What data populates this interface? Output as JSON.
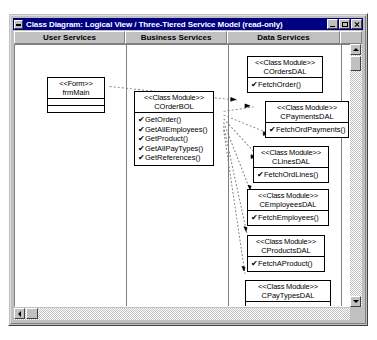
{
  "window": {
    "title": "Class Diagram: Logical View / Three-Tiered Service Model (read-only)",
    "minimize_label": "Minimize",
    "maximize_label": "Maximize",
    "close_label": "Close"
  },
  "columns": [
    {
      "label": "User Services"
    },
    {
      "label": "Business Services"
    },
    {
      "label": "Data Services"
    },
    {
      "label": ""
    }
  ],
  "classes": {
    "frm_main": {
      "stereotype": "<<Form>>",
      "name": "frmMain",
      "ops": []
    },
    "order_bol": {
      "stereotype": "<<Class Module>>",
      "name": "COrderBOL",
      "ops": [
        "GetOrder()",
        "GetAllEmployees()",
        "GetProduct()",
        "GetAllPayTypes()",
        "GetReferences()"
      ]
    },
    "orders_dal": {
      "stereotype": "<<Class Module>>",
      "name": "COrdersDAL",
      "ops": [
        "FetchOrder()"
      ]
    },
    "payments_dal": {
      "stereotype": "<<Class Module>>",
      "name": "CPaymentsDAL",
      "ops": [
        "FetchOrdPayments()"
      ]
    },
    "lines_dal": {
      "stereotype": "<<Class Module>>",
      "name": "CLinesDAL",
      "ops": [
        "FetchOrdLines()"
      ]
    },
    "employees_dal": {
      "stereotype": "<<Class Module>>",
      "name": "CEmployeesDAL",
      "ops": [
        "FetchEmployees()"
      ]
    },
    "products_dal": {
      "stereotype": "<<Class Module>>",
      "name": "CProductsDAL",
      "ops": [
        "FetchAProduct()"
      ]
    },
    "paytypes_dal": {
      "stereotype": "<<Class Module>>",
      "name": "CPayTypesDAL",
      "ops": [
        "FetchPaymentTypes()"
      ]
    }
  },
  "operation_marker": "✔",
  "colors": {
    "title_bar": "#000080",
    "title_text": "#ffffff",
    "chrome": "#c0c0c0",
    "canvas": "#ffffff",
    "line": "#000000"
  },
  "scrollbars": {
    "vertical": {
      "up": "▲",
      "down": "▼"
    },
    "horizontal": {
      "left": "◀",
      "right": "▶"
    }
  }
}
